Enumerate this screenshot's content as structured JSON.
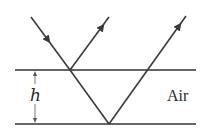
{
  "diagram": {
    "labels": {
      "thickness": "h",
      "medium": "Air"
    },
    "colors": {
      "line": "#333333",
      "ray": "#3a3a3a",
      "background": "#ffffff"
    },
    "surfaces": [
      {
        "name": "top-surface",
        "x1": 15,
        "x2": 196,
        "y": 70
      },
      {
        "name": "bottom-surface",
        "x1": 15,
        "x2": 196,
        "y": 124
      }
    ],
    "rays": [
      {
        "name": "incident-ray",
        "from": [
          31,
          17
        ],
        "to": [
          70,
          70
        ],
        "arrow": "down"
      },
      {
        "name": "reflected-ray-top",
        "from": [
          70,
          70
        ],
        "to": [
          109,
          17
        ],
        "arrow": "up"
      },
      {
        "name": "transmitted-ray",
        "from": [
          70,
          70
        ],
        "to": [
          109,
          124
        ]
      },
      {
        "name": "reflected-ray-bottom",
        "from": [
          109,
          124
        ],
        "to": [
          186,
          16
        ],
        "arrow": "up"
      }
    ]
  }
}
